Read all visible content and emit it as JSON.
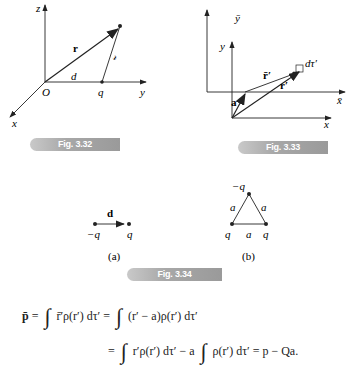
{
  "fig_3_32": {
    "caption": "Fig. 3.32",
    "labels": {
      "z_axis": "z",
      "y_axis": "y",
      "x_axis": "x",
      "origin": "O",
      "r": "r",
      "script_r": "𝓇",
      "d": "d",
      "q": "q"
    }
  },
  "fig_3_33": {
    "caption": "Fig. 3.33",
    "labels": {
      "ybar": "ȳ",
      "xbar": "x̄",
      "y": "y",
      "x": "x",
      "a": "a",
      "rbar_prime": "r̄′",
      "r_prime": "r′",
      "dtau": "dτ′"
    }
  },
  "fig_3_34": {
    "caption": "Fig. 3.34",
    "a": {
      "d": "d",
      "neg_q": "−q",
      "q": "q",
      "label": "(a)"
    },
    "b": {
      "top": "−q",
      "left_side": "a",
      "right_side": "a",
      "bottom_side": "a",
      "bottom_left": "q",
      "bottom_right": "q",
      "label": "(b)"
    }
  },
  "equation": {
    "line1": {
      "lhs": "p̄",
      "eq": "=",
      "t1": "r̄′ρ(r′) dτ′",
      "eq2": "=",
      "t2": "(r′ − a)ρ(r′) dτ′"
    },
    "line2": {
      "eq": "=",
      "t1": "r′ρ(r′) dτ′ − a",
      "t2": "ρ(r′) dτ′ = p − Qa."
    }
  }
}
